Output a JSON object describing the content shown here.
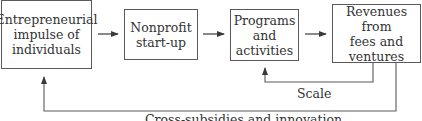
{
  "diagram": {
    "nodes": [
      {
        "id": "entrepreneurial-impulse",
        "label": "Entrepreneurial\nimpulse of\nindividuals"
      },
      {
        "id": "nonprofit-startup",
        "label": "Nonprofit\nstart-up"
      },
      {
        "id": "programs-activities",
        "label": "Programs\nand\nactivities"
      },
      {
        "id": "revenues",
        "label": "Revenues from\nfees and\nventures"
      }
    ],
    "edges": [
      {
        "from": "entrepreneurial-impulse",
        "to": "nonprofit-startup",
        "label": ""
      },
      {
        "from": "nonprofit-startup",
        "to": "programs-activities",
        "label": ""
      },
      {
        "from": "programs-activities",
        "to": "revenues",
        "label": ""
      },
      {
        "from": "revenues",
        "to": "programs-activities",
        "label": "Scale"
      },
      {
        "from": "revenues",
        "to": "entrepreneurial-impulse",
        "label": "Cross-subsidies and innovation"
      }
    ],
    "colors": {
      "line": "#5a5a5a",
      "text": "#333333"
    }
  }
}
